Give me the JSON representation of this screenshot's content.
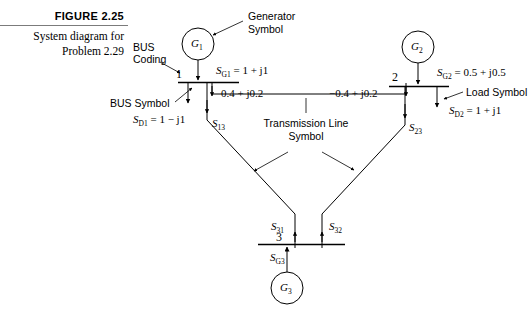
{
  "figure": {
    "title": "FIGURE 2.25",
    "caption_line1": "System diagram for",
    "caption_line2": "Problem 2.29"
  },
  "annotations": {
    "generator_symbol_line1": "Generator",
    "generator_symbol_line2": "Symbol",
    "bus_coding_line1": "BUS",
    "bus_coding_line2": "Coding",
    "bus_symbol": "BUS Symbol",
    "load_symbol": "Load Symbol",
    "transmission_line_line1": "Transmission Line",
    "transmission_line_line2": "Symbol"
  },
  "buses": [
    {
      "number": "1",
      "generator": "G",
      "generator_sub": "1"
    },
    {
      "number": "2",
      "generator": "G",
      "generator_sub": "2"
    },
    {
      "number": "3",
      "generator": "G",
      "generator_sub": "3"
    }
  ],
  "quantities": {
    "sg1": {
      "sym": "S",
      "sub": "G1",
      "value": "1 + j1"
    },
    "sd1": {
      "sym": "S",
      "sub": "D1",
      "value": "1 − j1"
    },
    "sg2": {
      "sym": "S",
      "sub": "G2",
      "value": "0.5 + j0.5"
    },
    "sd2": {
      "sym": "S",
      "sub": "D2",
      "value": "1 + j1"
    },
    "sg3": {
      "sym": "S",
      "sub": "G3",
      "value": ""
    },
    "s13": {
      "sym": "S",
      "sub": "13",
      "value": ""
    },
    "s23": {
      "sym": "S",
      "sub": "23",
      "value": ""
    },
    "s31": {
      "sym": "S",
      "sub": "31",
      "value": ""
    },
    "s32": {
      "sym": "S",
      "sub": "32",
      "value": ""
    }
  },
  "flows": {
    "line12_left": "0.4 + j0.2",
    "line12_right": "−0.4 + j0.2"
  },
  "colors": {
    "ink": "#000000",
    "rule": "#7b7b7b",
    "background": "#ffffff"
  }
}
